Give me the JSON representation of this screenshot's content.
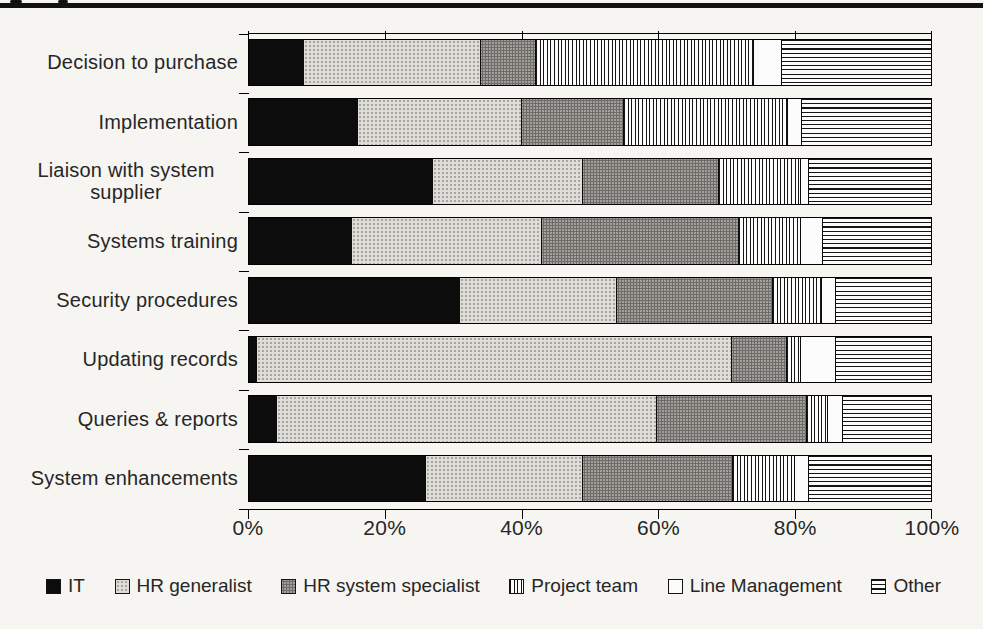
{
  "figure": {
    "background_color": "#f6f5f2",
    "top_rule_color": "#121212",
    "text_color": "#262626"
  },
  "chart_data": {
    "type": "bar",
    "orientation": "horizontal",
    "stacked": true,
    "title": "",
    "xlabel": "",
    "ylabel": "",
    "xlim": [
      0,
      100
    ],
    "grid": false,
    "legend_position": "bottom",
    "x_ticks": [
      "0%",
      "20%",
      "40%",
      "60%",
      "80%",
      "100%"
    ],
    "x_tick_values": [
      0,
      20,
      40,
      60,
      80,
      100
    ],
    "categories": [
      "Decision to purchase",
      "Implementation",
      "Liaison with system supplier",
      "Systems training",
      "Security procedures",
      "Updating records",
      "Queries & reports",
      "System enhancements"
    ],
    "series": [
      {
        "name": "IT",
        "pattern": "solid-black",
        "swatch_color": "#0c0c0c",
        "values": [
          8,
          16,
          27,
          15,
          31,
          1,
          4,
          26
        ]
      },
      {
        "name": "HR generalist",
        "pattern": "light-gray-dots",
        "swatch_color": "#deddd8",
        "values": [
          26,
          24,
          22,
          28,
          23,
          70,
          56,
          23
        ]
      },
      {
        "name": "HR system specialist",
        "pattern": "dark-gray-dots",
        "swatch_color": "#a3a09b",
        "values": [
          8,
          15,
          20,
          29,
          23,
          8,
          22,
          22
        ]
      },
      {
        "name": "Project team",
        "pattern": "vertical-stripes",
        "swatch_color": "#fcfcfc",
        "values": [
          32,
          24,
          12,
          9,
          7,
          2,
          3,
          9
        ]
      },
      {
        "name": "Line Management",
        "pattern": "white",
        "swatch_color": "#fcfcfc",
        "values": [
          4,
          2,
          1,
          3,
          2,
          5,
          2,
          2
        ]
      },
      {
        "name": "Other",
        "pattern": "horizontal-stripes",
        "swatch_color": "#fcfcfc",
        "values": [
          22,
          19,
          18,
          16,
          14,
          14,
          13,
          18
        ]
      }
    ]
  }
}
